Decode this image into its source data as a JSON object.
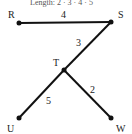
{
  "header": {
    "text": "Length: 2 · 3 · 4 · 5"
  },
  "colors": {
    "line": "#111111",
    "text": "#222222",
    "background": "#ffffff"
  },
  "nodes": [
    {
      "id": "R",
      "label": "R",
      "x": 19,
      "y": 23,
      "lx": 9,
      "ly": 18
    },
    {
      "id": "S",
      "label": "S",
      "x": 111,
      "y": 22,
      "lx": 119,
      "ly": 18
    },
    {
      "id": "T",
      "label": "T",
      "x": 64,
      "y": 70,
      "lx": 54,
      "ly": 66
    },
    {
      "id": "U",
      "label": "U",
      "x": 19,
      "y": 118,
      "lx": 8,
      "ly": 132
    },
    {
      "id": "W",
      "label": "W",
      "x": 111,
      "y": 118,
      "lx": 117,
      "ly": 132
    }
  ],
  "edges": [
    {
      "from": "R",
      "to": "S",
      "weight": "4",
      "lx": 62,
      "ly": 18
    },
    {
      "from": "S",
      "to": "T",
      "weight": "3",
      "lx": 77,
      "ly": 45
    },
    {
      "from": "T",
      "to": "U",
      "weight": "5",
      "lx": 47,
      "ly": 103
    },
    {
      "from": "T",
      "to": "W",
      "weight": "2",
      "lx": 91,
      "ly": 92
    }
  ]
}
